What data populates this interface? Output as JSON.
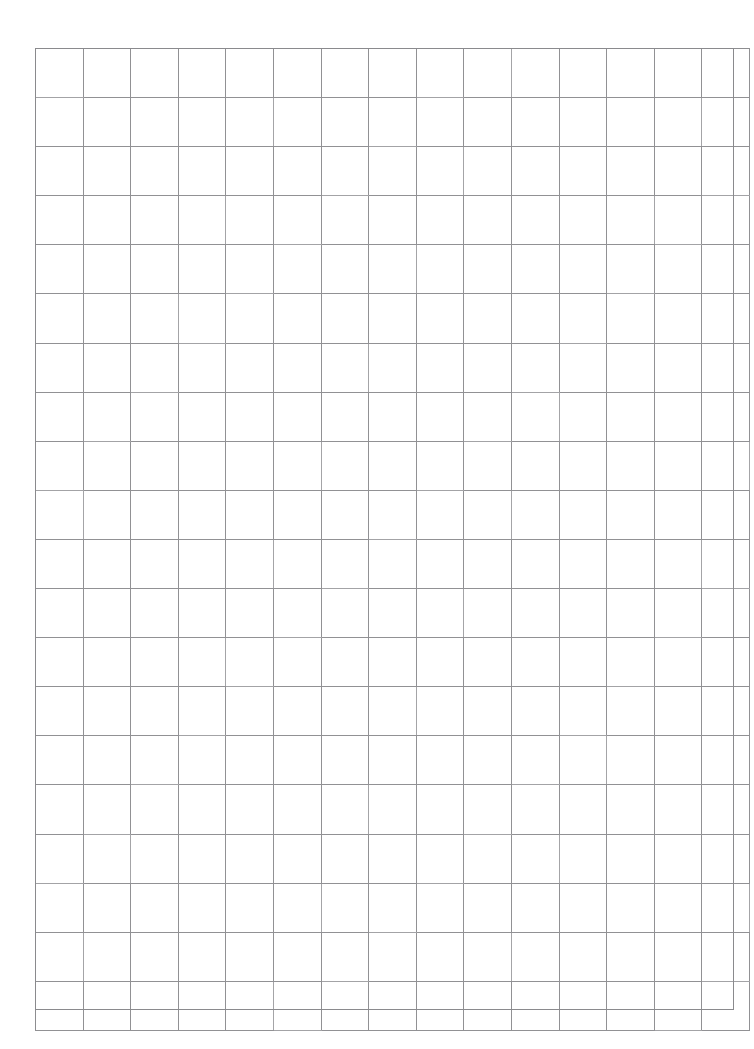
{
  "document": {
    "kind": "scanned-grid-paper",
    "page_width": 754,
    "page_height": 1049,
    "background_color": "#ffffff",
    "caption": "",
    "title": "",
    "body_text": ""
  },
  "grid": {
    "columns": 15,
    "rows": 20,
    "origin_x": 35,
    "origin_y": 48,
    "width": 699,
    "height": 962,
    "cell_width": 46.6,
    "cell_height": 48.1,
    "line_color": "#919194",
    "line_width_px": 1,
    "frame_color": "#8a8a8d",
    "fill_color": "#ffffff",
    "cells_text": []
  },
  "margins": {
    "left": 35,
    "top": 48,
    "right": 20,
    "bottom": 39
  },
  "annotations": {
    "items": []
  }
}
